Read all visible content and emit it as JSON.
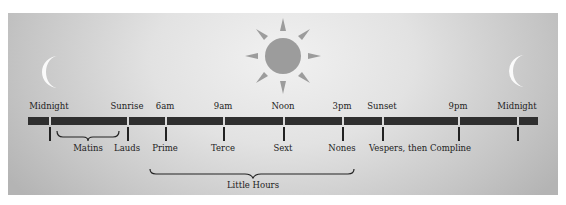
{
  "diagram": {
    "colors": {
      "timeline_bar": "#2f2f2f",
      "sun": "#9c9c9c",
      "moon": "#fafafa",
      "background_light": "#f1f1f1",
      "background_dark": "#b4b4b4"
    },
    "icons": [
      {
        "name": "moon-icon",
        "position": "left"
      },
      {
        "name": "sun-icon",
        "position": "center"
      },
      {
        "name": "moon-icon",
        "position": "right"
      }
    ],
    "time_markers": [
      {
        "label": "Midnight",
        "x": 49
      },
      {
        "label": "Sunrise",
        "x": 127
      },
      {
        "label": "6am",
        "x": 165
      },
      {
        "label": "9am",
        "x": 223
      },
      {
        "label": "Noon",
        "x": 283
      },
      {
        "label": "3pm",
        "x": 342
      },
      {
        "label": "Sunset",
        "x": 382
      },
      {
        "label": "9pm",
        "x": 458
      },
      {
        "label": "Midnight",
        "x": 517
      }
    ],
    "hours": [
      {
        "label": "Matins",
        "x": 88
      },
      {
        "label": "Lauds",
        "x": 127
      },
      {
        "label": "Prime",
        "x": 165
      },
      {
        "label": "Terce",
        "x": 223
      },
      {
        "label": "Sext",
        "x": 283
      },
      {
        "label": "Nones",
        "x": 342
      },
      {
        "label": "Vespers, then Compline",
        "x": 420
      }
    ],
    "groups": [
      {
        "label": "Little Hours",
        "from": "Prime",
        "to": "Nones"
      }
    ]
  }
}
